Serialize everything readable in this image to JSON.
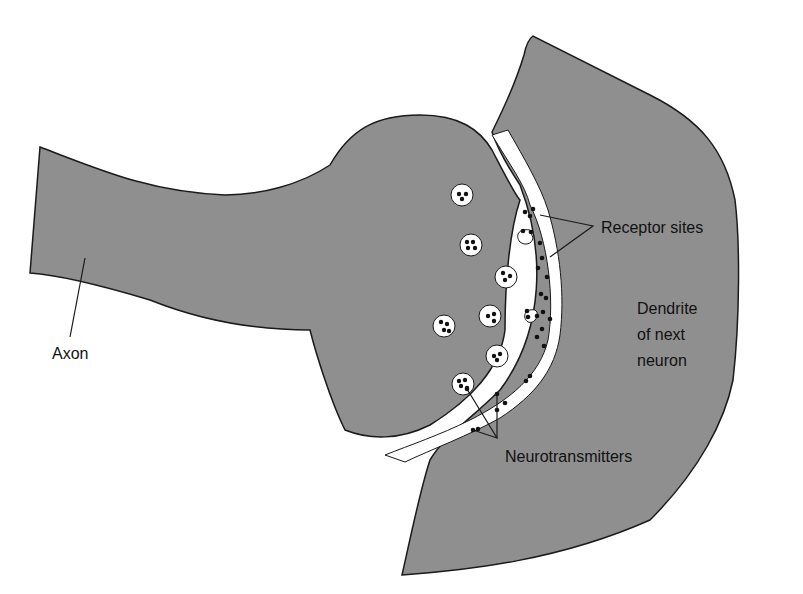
{
  "diagram": {
    "type": "synapse",
    "colors": {
      "tissue": "#8f8f8f",
      "outline": "#1a1a1a",
      "cleft": "#ffffff",
      "background": "#ffffff"
    },
    "labels": {
      "axon": "Axon",
      "receptor_sites": "Receptor sites",
      "dendrite_line1": "Dendrite",
      "dendrite_line2": "of next",
      "dendrite_line3": "neuron",
      "neurotransmitters": "Neurotransmitters"
    },
    "vesicle_count": 8
  }
}
